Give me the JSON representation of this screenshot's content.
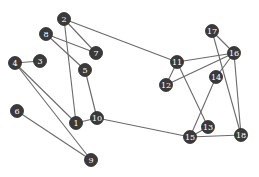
{
  "diagram": {
    "type": "undirected-graph",
    "node_color": "#3a3a3a",
    "edge_color": "#6a6a6a",
    "label_color": "#ffffff",
    "nodes": [
      {
        "id": "1",
        "label": "1",
        "x": 76,
        "y": 123
      },
      {
        "id": "2",
        "label": "2",
        "x": 64,
        "y": 19
      },
      {
        "id": "3",
        "label": "3",
        "x": 40,
        "y": 61
      },
      {
        "id": "4",
        "label": "4",
        "x": 15,
        "y": 63
      },
      {
        "id": "5",
        "label": "5",
        "x": 85,
        "y": 70
      },
      {
        "id": "6",
        "label": "6",
        "x": 17,
        "y": 111
      },
      {
        "id": "7",
        "label": "7",
        "x": 96,
        "y": 53
      },
      {
        "id": "8",
        "label": "8",
        "x": 46,
        "y": 34
      },
      {
        "id": "9",
        "label": "9",
        "x": 91,
        "y": 160
      },
      {
        "id": "10",
        "label": "10",
        "x": 97,
        "y": 118
      },
      {
        "id": "11",
        "label": "11",
        "x": 177,
        "y": 62
      },
      {
        "id": "12",
        "label": "12",
        "x": 166,
        "y": 85
      },
      {
        "id": "13",
        "label": "13",
        "x": 208,
        "y": 127
      },
      {
        "id": "14",
        "label": "14",
        "x": 216,
        "y": 77
      },
      {
        "id": "15",
        "label": "15",
        "x": 190,
        "y": 137
      },
      {
        "id": "16",
        "label": "16",
        "x": 234,
        "y": 53
      },
      {
        "id": "17",
        "label": "17",
        "x": 212,
        "y": 31
      },
      {
        "id": "18",
        "label": "18",
        "x": 241,
        "y": 135
      }
    ],
    "edges": [
      [
        "2",
        "7"
      ],
      [
        "2",
        "1"
      ],
      [
        "2",
        "11"
      ],
      [
        "8",
        "7"
      ],
      [
        "8",
        "5"
      ],
      [
        "4",
        "3"
      ],
      [
        "4",
        "1"
      ],
      [
        "4",
        "9"
      ],
      [
        "1",
        "10"
      ],
      [
        "5",
        "10"
      ],
      [
        "6",
        "9"
      ],
      [
        "10",
        "15"
      ],
      [
        "11",
        "16"
      ],
      [
        "11",
        "12"
      ],
      [
        "11",
        "13"
      ],
      [
        "12",
        "16"
      ],
      [
        "17",
        "16"
      ],
      [
        "17",
        "18"
      ],
      [
        "16",
        "14"
      ],
      [
        "16",
        "18"
      ],
      [
        "14",
        "15"
      ],
      [
        "13",
        "15"
      ],
      [
        "15",
        "18"
      ]
    ]
  }
}
